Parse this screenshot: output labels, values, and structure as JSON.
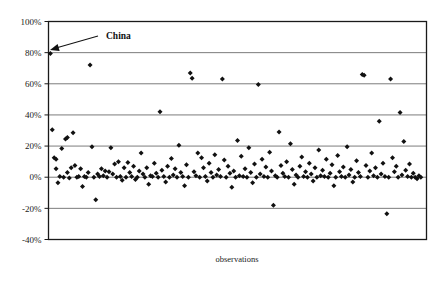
{
  "chart_data": {
    "type": "scatter",
    "title": "",
    "xlabel": "observations",
    "ylabel": "",
    "ylim": [
      -0.4,
      1.0
    ],
    "ytick_values": [
      1.0,
      0.8,
      0.6,
      0.4,
      0.2,
      0.0,
      -0.2,
      -0.4
    ],
    "ytick_labels": [
      "100%",
      "80%",
      "60%",
      "40%",
      "20%",
      "0%",
      "-20%",
      "-40%"
    ],
    "xlim": [
      0,
      200
    ],
    "xtick_labels": [],
    "grid": "horizontal",
    "legend": "none",
    "marker": "diamond",
    "marker_color": "#111111",
    "annotations": [
      {
        "text": "China",
        "label_x": 106,
        "label_y": 39,
        "arrow_from_x": 98,
        "arrow_from_y": 36,
        "arrow_to_x": 50,
        "arrow_to_y": 50,
        "points_to_value": 0.795
      }
    ],
    "series": [
      {
        "name": "observations",
        "points": [
          [
            1,
            0.795
          ],
          [
            2,
            0.305
          ],
          [
            3,
            0.125
          ],
          [
            4,
            0.115
          ],
          [
            4,
            0.055
          ],
          [
            5,
            -0.035
          ],
          [
            6,
            0.005
          ],
          [
            7,
            0.185
          ],
          [
            8,
            0.0
          ],
          [
            9,
            0.245
          ],
          [
            10,
            0.255
          ],
          [
            10,
            0.03
          ],
          [
            11,
            -0.005
          ],
          [
            12,
            0.06
          ],
          [
            13,
            0.285
          ],
          [
            14,
            0.075
          ],
          [
            15,
            0.0
          ],
          [
            16,
            0.005
          ],
          [
            17,
            0.055
          ],
          [
            18,
            -0.06
          ],
          [
            19,
            0.005
          ],
          [
            20,
            0.0
          ],
          [
            21,
            0.03
          ],
          [
            22,
            0.72
          ],
          [
            23,
            0.195
          ],
          [
            24,
            0.0
          ],
          [
            25,
            -0.145
          ],
          [
            26,
            0.02
          ],
          [
            27,
            0.005
          ],
          [
            28,
            0.055
          ],
          [
            29,
            0.01
          ],
          [
            30,
            0.04
          ],
          [
            31,
            0.0
          ],
          [
            32,
            0.035
          ],
          [
            33,
            0.19
          ],
          [
            34,
            0.02
          ],
          [
            35,
            0.085
          ],
          [
            36,
            0.0
          ],
          [
            37,
            0.1
          ],
          [
            38,
            0.005
          ],
          [
            39,
            -0.02
          ],
          [
            40,
            0.06
          ],
          [
            41,
            0.0
          ],
          [
            42,
            0.095
          ],
          [
            43,
            0.03
          ],
          [
            44,
            0.005
          ],
          [
            45,
            0.07
          ],
          [
            46,
            -0.015
          ],
          [
            47,
            0.0
          ],
          [
            48,
            0.04
          ],
          [
            49,
            0.155
          ],
          [
            50,
            0.02
          ],
          [
            51,
            0.0
          ],
          [
            52,
            0.06
          ],
          [
            53,
            -0.045
          ],
          [
            54,
            0.01
          ],
          [
            55,
            0.005
          ],
          [
            56,
            0.09
          ],
          [
            57,
            0.025
          ],
          [
            58,
            0.0
          ],
          [
            59,
            0.42
          ],
          [
            60,
            0.045
          ],
          [
            61,
            0.005
          ],
          [
            62,
            -0.03
          ],
          [
            63,
            0.07
          ],
          [
            64,
            0.0
          ],
          [
            65,
            0.12
          ],
          [
            66,
            0.015
          ],
          [
            67,
            0.055
          ],
          [
            68,
            0.0
          ],
          [
            69,
            0.205
          ],
          [
            70,
            0.03
          ],
          [
            71,
            0.005
          ],
          [
            72,
            -0.055
          ],
          [
            73,
            0.08
          ],
          [
            74,
            0.0
          ],
          [
            75,
            0.67
          ],
          [
            76,
            0.635
          ],
          [
            77,
            0.035
          ],
          [
            78,
            0.01
          ],
          [
            79,
            0.155
          ],
          [
            80,
            0.0
          ],
          [
            81,
            0.125
          ],
          [
            82,
            0.06
          ],
          [
            83,
            0.005
          ],
          [
            84,
            -0.025
          ],
          [
            85,
            0.09
          ],
          [
            86,
            0.03
          ],
          [
            87,
            0.0
          ],
          [
            88,
            0.145
          ],
          [
            89,
            0.015
          ],
          [
            90,
            0.05
          ],
          [
            91,
            0.005
          ],
          [
            92,
            0.63
          ],
          [
            93,
            0.11
          ],
          [
            94,
            0.0
          ],
          [
            95,
            0.07
          ],
          [
            96,
            0.025
          ],
          [
            97,
            -0.065
          ],
          [
            98,
            0.04
          ],
          [
            99,
            0.0
          ],
          [
            100,
            0.235
          ],
          [
            101,
            0.01
          ],
          [
            102,
            0.135
          ],
          [
            103,
            0.005
          ],
          [
            104,
            0.055
          ],
          [
            105,
            0.0
          ],
          [
            106,
            0.19
          ],
          [
            107,
            0.03
          ],
          [
            108,
            -0.035
          ],
          [
            109,
            0.085
          ],
          [
            110,
            0.0
          ],
          [
            111,
            0.595
          ],
          [
            112,
            0.02
          ],
          [
            113,
            0.115
          ],
          [
            114,
            0.005
          ],
          [
            115,
            0.065
          ],
          [
            116,
            0.0
          ],
          [
            117,
            0.16
          ],
          [
            118,
            0.04
          ],
          [
            119,
            -0.18
          ],
          [
            120,
            0.01
          ],
          [
            121,
            0.0
          ],
          [
            122,
            0.29
          ],
          [
            123,
            0.075
          ],
          [
            124,
            0.025
          ],
          [
            125,
            0.005
          ],
          [
            126,
            0.1
          ],
          [
            127,
            0.0
          ],
          [
            128,
            0.215
          ],
          [
            129,
            0.05
          ],
          [
            130,
            -0.045
          ],
          [
            131,
            0.015
          ],
          [
            132,
            0.0
          ],
          [
            133,
            0.07
          ],
          [
            134,
            0.13
          ],
          [
            135,
            0.005
          ],
          [
            136,
            0.035
          ],
          [
            137,
            0.0
          ],
          [
            138,
            0.09
          ],
          [
            139,
            0.02
          ],
          [
            140,
            -0.025
          ],
          [
            141,
            0.06
          ],
          [
            142,
            0.0
          ],
          [
            143,
            0.175
          ],
          [
            144,
            0.01
          ],
          [
            145,
            0.045
          ],
          [
            146,
            0.005
          ],
          [
            147,
            0.115
          ],
          [
            148,
            0.0
          ],
          [
            149,
            0.025
          ],
          [
            150,
            0.08
          ],
          [
            151,
            -0.055
          ],
          [
            152,
            0.0
          ],
          [
            153,
            0.14
          ],
          [
            154,
            0.035
          ],
          [
            155,
            0.005
          ],
          [
            156,
            0.065
          ],
          [
            157,
            0.0
          ],
          [
            158,
            0.195
          ],
          [
            159,
            0.015
          ],
          [
            160,
            0.05
          ],
          [
            161,
            -0.03
          ],
          [
            162,
            0.0
          ],
          [
            163,
            0.105
          ],
          [
            164,
            0.03
          ],
          [
            165,
            0.005
          ],
          [
            166,
            0.66
          ],
          [
            167,
            0.655
          ],
          [
            168,
            0.075
          ],
          [
            169,
            0.0
          ],
          [
            170,
            0.04
          ],
          [
            171,
            0.155
          ],
          [
            172,
            0.01
          ],
          [
            173,
            0.06
          ],
          [
            174,
            0.0
          ],
          [
            175,
            0.36
          ],
          [
            176,
            0.02
          ],
          [
            177,
            0.09
          ],
          [
            178,
            0.005
          ],
          [
            179,
            -0.235
          ],
          [
            180,
            0.0
          ],
          [
            181,
            0.63
          ],
          [
            182,
            0.125
          ],
          [
            183,
            0.035
          ],
          [
            184,
            0.07
          ],
          [
            185,
            0.0
          ],
          [
            186,
            0.415
          ],
          [
            187,
            0.015
          ],
          [
            188,
            0.23
          ],
          [
            189,
            0.045
          ],
          [
            190,
            0.005
          ],
          [
            191,
            0.085
          ],
          [
            192,
            0.0
          ],
          [
            193,
            0.025
          ],
          [
            194,
            0.0
          ],
          [
            195,
            -0.01
          ],
          [
            196,
            0.01
          ],
          [
            197,
            0.0
          ]
        ]
      }
    ]
  }
}
